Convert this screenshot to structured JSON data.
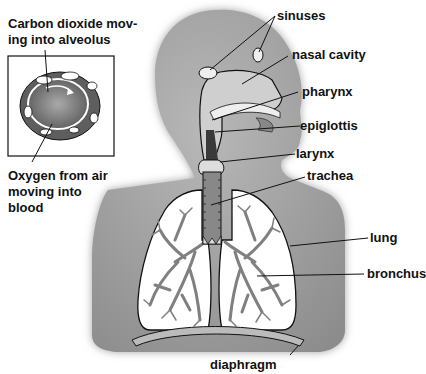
{
  "diagram": {
    "inset": {
      "top_caption": "Carbon dioxide moving into alveolus",
      "top_caption_line1": "Carbon dioxide mov-",
      "top_caption_line2": "ing into alveolus",
      "bottom_caption_line1": "Oxygen from air",
      "bottom_caption_line2": "moving into",
      "bottom_caption_line3": "blood"
    },
    "labels": {
      "sinuses": "sinuses",
      "nasal_cavity": "nasal cavity",
      "pharynx": "pharynx",
      "epiglottis": "epiglottis",
      "larynx": "larynx",
      "trachea": "trachea",
      "lung": "lung",
      "bronchus": "bronchus",
      "diaphragm": "diaphragm"
    },
    "colors": {
      "body": "#9a9a9a",
      "lung_fill": "#ffffff",
      "bronchi": "#808080",
      "outline": "#111111",
      "airway_dark": "#3a3a3a"
    }
  }
}
